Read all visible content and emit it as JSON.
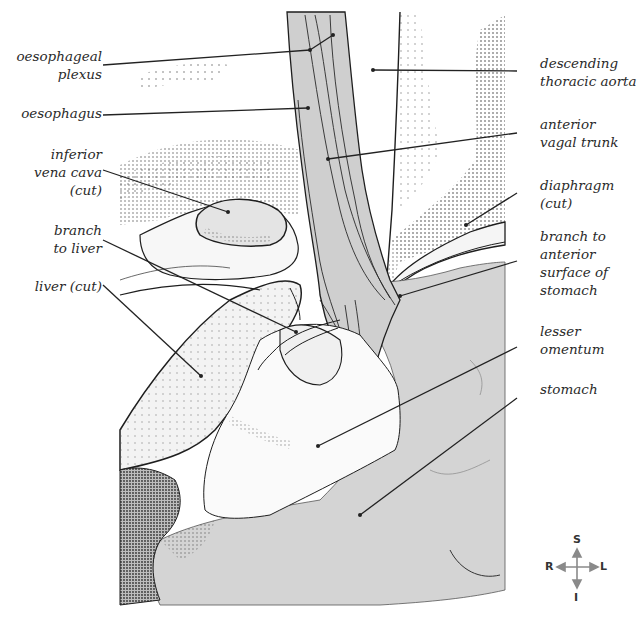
{
  "figure": {
    "colors": {
      "background": "#ffffff",
      "organ_fill": "#d4d4d4",
      "light_fill": "#ececec",
      "stipple": "#555555",
      "outline": "#1e1e1e",
      "leader": "#222222",
      "text": "#2a2a2a"
    }
  },
  "labels": {
    "left": [
      {
        "id": "oesophageal-plexus",
        "text": "oesophageal\nplexus"
      },
      {
        "id": "oesophagus",
        "text": "oesophagus"
      },
      {
        "id": "inferior-vena-cava",
        "text": "inferior\nvena cava\n(cut)"
      },
      {
        "id": "branch-to-liver",
        "text": "branch\nto liver"
      },
      {
        "id": "liver",
        "text": "liver (cut)"
      }
    ],
    "right": [
      {
        "id": "descending-thoracic-aorta",
        "text": "descending\nthoracic aorta"
      },
      {
        "id": "anterior-vagal-trunk",
        "text": "anterior\nvagal trunk"
      },
      {
        "id": "diaphragm",
        "text": "diaphragm\n(cut)"
      },
      {
        "id": "branch-to-stomach",
        "text": "branch to\nanterior\nsurface of\nstomach"
      },
      {
        "id": "lesser-omentum",
        "text": "lesser\nomentum"
      },
      {
        "id": "stomach",
        "text": "stomach"
      }
    ]
  },
  "compass": {
    "superior": "S",
    "inferior": "I",
    "right": "R",
    "left": "L"
  }
}
